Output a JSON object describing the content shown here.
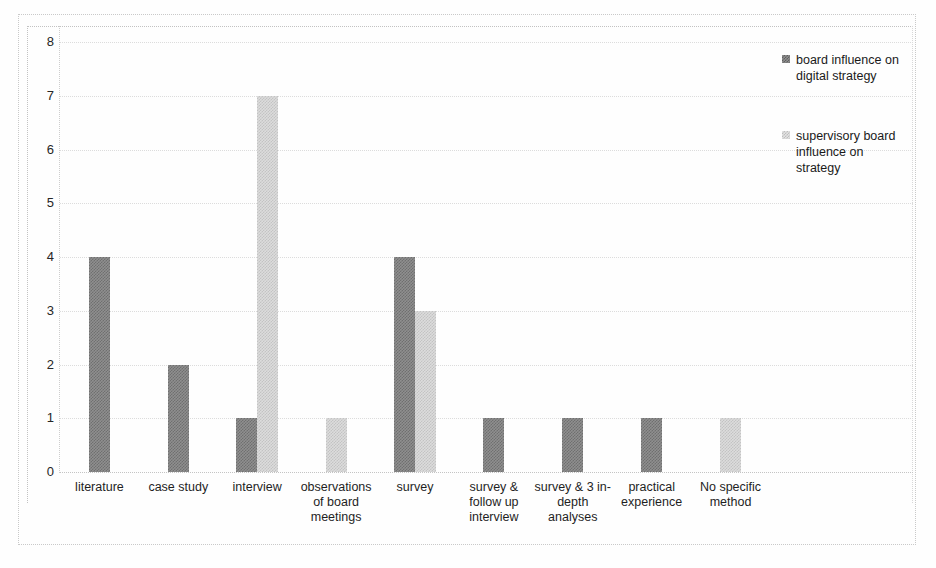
{
  "chart_data": {
    "type": "bar",
    "title": "",
    "subtitle": "",
    "xlabel": "",
    "ylabel": "",
    "ylim": [
      0,
      8
    ],
    "yticks": [
      "0",
      "1",
      "2",
      "3",
      "4",
      "5",
      "6",
      "7",
      "8"
    ],
    "grid": true,
    "legend_position": "right",
    "categories": [
      "literature",
      "case study",
      "interview",
      "observations of board meetings",
      "survey",
      "survey & follow up interview",
      "survey & 3 in-depth analyses",
      "practical experience",
      "No specific method"
    ],
    "series": [
      {
        "name": "board influence on digital strategy",
        "color": "#7a7a7a",
        "values": [
          4,
          2,
          1,
          0,
          4,
          1,
          1,
          1,
          0
        ]
      },
      {
        "name": "supervisory board influence on strategy",
        "color": "#cfcfcf",
        "values": [
          0,
          0,
          7,
          1,
          3,
          0,
          0,
          0,
          1
        ]
      }
    ]
  },
  "legend": {
    "entries": [
      {
        "label": "board influence on digital strategy"
      },
      {
        "label": "supervisory board influence on strategy"
      }
    ]
  }
}
